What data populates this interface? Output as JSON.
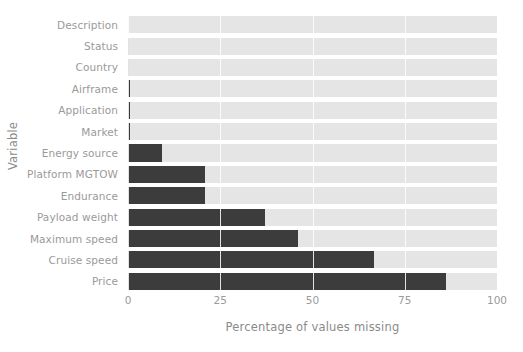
{
  "chart_data": {
    "type": "bar",
    "orientation": "horizontal",
    "title": "",
    "xlabel": "Percentage of values missing",
    "ylabel": "Variable",
    "categories": [
      "Description",
      "Status",
      "Country",
      "Airframe",
      "Application",
      "Market",
      "Energy source",
      "Platform MGTOW",
      "Endurance",
      "Payload weight",
      "Maximum speed",
      "Cruise speed",
      "Price"
    ],
    "values": [
      0.0,
      0.1,
      0.2,
      0.5,
      0.5,
      0.5,
      9.2,
      20.8,
      20.8,
      37.0,
      46.0,
      66.8,
      86.3
    ],
    "xlim": [
      0,
      100
    ],
    "xticks": [
      0,
      25,
      50,
      75,
      100
    ],
    "xtick_labels": [
      "0",
      "25",
      "50",
      "75",
      "100"
    ],
    "grid": "vertical-white",
    "legend": "none",
    "bar_color": "#3c3c3c",
    "track_color": "#e5e5e5",
    "background_color": "#ffffff",
    "tick_text_color": "#9a9a9a",
    "axis_title_color": "#8a8a8a"
  }
}
